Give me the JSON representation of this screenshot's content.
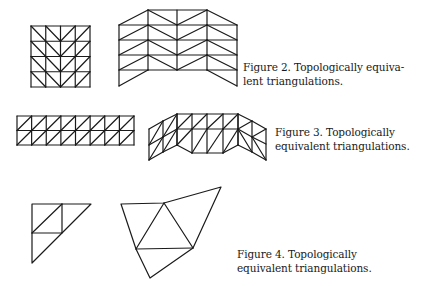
{
  "captions": {
    "figure2": {
      "line1": "Figure 2.  Topologically equiva-",
      "line2": "lent triangulations."
    },
    "figure3": {
      "line1": "Figure 3.  Topologically",
      "line2": "equivalent triangulations."
    },
    "figure4": {
      "line1": "Figure 4.  Topologically",
      "line2": "equivalent triangulations."
    }
  },
  "figures": {
    "figure2": {
      "left": "4x4 square grid mesh with chevron diagonals",
      "right": "folded 4-panel triangulated surface"
    },
    "figure3": {
      "left": "8x2 strip mesh with diagonals",
      "right": "bent strip triangulated surface"
    },
    "figure4": {
      "left": "right-triangle with 4 sub-triangles",
      "right": "distorted polygon with 4 triangles"
    }
  }
}
